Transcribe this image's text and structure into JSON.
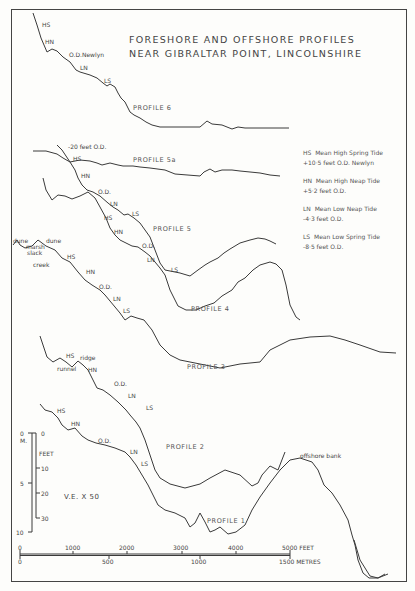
{
  "title": {
    "line1": "FORESHORE AND OFFSHORE PROFILES",
    "line2": "NEAR GIBRALTAR POINT, LINCOLNSHIRE"
  },
  "legend": [
    {
      "code": "HS",
      "name": "Mean High Spring Tide",
      "value": "+10·5 feet O.D. Newlyn"
    },
    {
      "code": "HN",
      "name": "Mean High Neap Tide",
      "value": "+5·2 feet O.D."
    },
    {
      "code": "LN",
      "name": "Mean Low Neap Tide",
      "value": "-4·3 feet O.D."
    },
    {
      "code": "LS",
      "name": "Mean Low Spring Tide",
      "value": "-8·5 feet O.D."
    }
  ],
  "profiles": [
    {
      "name": "PROFILE 6",
      "labels": [
        "HS",
        "HN",
        "O.D.Newlyn",
        "LN",
        "LS"
      ]
    },
    {
      "name": "PROFILE 5a",
      "labels": [
        "-20 feet O.D.",
        "HS",
        "HN",
        "O.D.",
        "LN",
        "LS"
      ]
    },
    {
      "name": "PROFILE 5",
      "labels": [
        "HS",
        "HN",
        "O.D.",
        "LN",
        "LS"
      ]
    },
    {
      "name": "PROFILE 4",
      "labels": [
        "dune",
        "marsh",
        "slack",
        "dune",
        "creek",
        "HS",
        "HN",
        "O.D.",
        "LN",
        "LS"
      ]
    },
    {
      "name": "PROFILE 3",
      "labels": [
        "HS",
        "ridge",
        "runnel",
        "HN",
        "O.D.",
        "LN",
        "LS"
      ]
    },
    {
      "name": "PROFILE 2",
      "labels": [
        "HS",
        "HN",
        "O.D.",
        "LN",
        "LS"
      ]
    },
    {
      "name": "PROFILE 1",
      "labels": [
        "offshore bank"
      ]
    }
  ],
  "vertical_scale": {
    "metres_label": "M.",
    "feet_label": "FEET",
    "metres_ticks": [
      "0",
      "5",
      "10"
    ],
    "feet_ticks": [
      "0",
      "10",
      "20",
      "30"
    ]
  },
  "vertical_exaggeration": "V.E. X 50",
  "horizontal_scale": {
    "feet_ticks": [
      "0",
      "1000",
      "2000",
      "3000",
      "4000",
      "5000 FEET"
    ],
    "metres_ticks": [
      "0",
      "500",
      "1000",
      "1500 METRES"
    ]
  }
}
